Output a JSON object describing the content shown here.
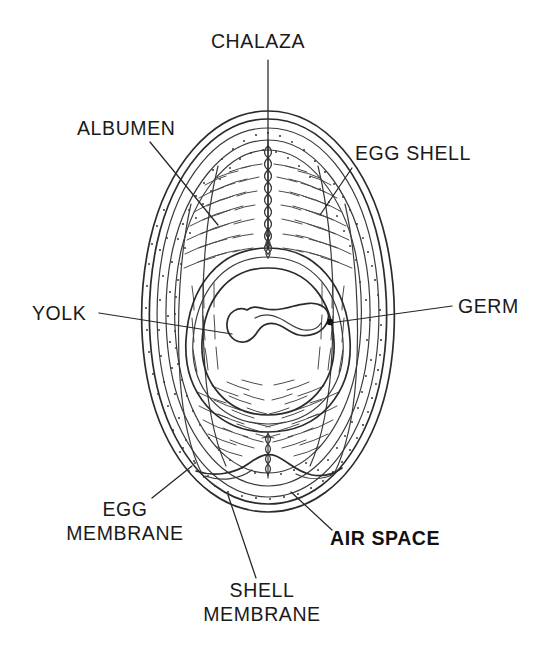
{
  "figure": {
    "background_color": "#ffffff",
    "line_color": "#2b2b2b",
    "text_color": "#1a1a1a",
    "width": 545,
    "height": 659
  },
  "labels": [
    {
      "id": "chalaza",
      "text": "CHALAZA",
      "lines": [
        "CHALAZA"
      ],
      "bold": false,
      "x": 258,
      "y": 48,
      "anchor": "middle",
      "leader_from": [
        268,
        60
      ],
      "leader_to": [
        268,
        250
      ]
    },
    {
      "id": "albumen",
      "text": "ALBUMEN",
      "lines": [
        "ALBUMEN"
      ],
      "bold": false,
      "x": 77,
      "y": 135,
      "anchor": "start",
      "leader_from": [
        150,
        142
      ],
      "leader_to": [
        218,
        225
      ]
    },
    {
      "id": "egg-shell",
      "text": "EGG  SHELL",
      "lines": [
        "EGG  SHELL"
      ],
      "bold": false,
      "x": 355,
      "y": 160,
      "anchor": "start",
      "leader_from": [
        352,
        168
      ],
      "leader_to": [
        320,
        215
      ]
    },
    {
      "id": "yolk",
      "text": "YOLK",
      "lines": [
        "YOLK"
      ],
      "bold": false,
      "x": 32,
      "y": 320,
      "anchor": "start",
      "leader_from": [
        99,
        313
      ],
      "leader_to": [
        232,
        334
      ]
    },
    {
      "id": "germ",
      "text": "GERM",
      "lines": [
        "GERM"
      ],
      "bold": false,
      "x": 458,
      "y": 313,
      "anchor": "start",
      "leader_from": [
        452,
        306
      ],
      "leader_to": [
        330,
        323
      ]
    },
    {
      "id": "egg-membrane",
      "text": "EGG MEMBRANE",
      "lines": [
        "EGG",
        "MEMBRANE"
      ],
      "bold": false,
      "x": 125,
      "y": 516,
      "anchor": "middle",
      "leader_from": [
        152,
        498
      ],
      "leader_to": [
        192,
        466
      ]
    },
    {
      "id": "shell-membrane",
      "text": "SHELL MEMBRANE",
      "lines": [
        "SHELL",
        "MEMBRANE"
      ],
      "bold": false,
      "x": 262,
      "y": 597,
      "anchor": "middle",
      "leader_from": [
        256,
        578
      ],
      "leader_to": [
        228,
        495
      ]
    },
    {
      "id": "air-space",
      "text": "AIR  SPACE",
      "lines": [
        "AIR  SPACE"
      ],
      "bold": true,
      "x": 330,
      "y": 545,
      "anchor": "start",
      "leader_from": [
        332,
        530
      ],
      "leader_to": [
        291,
        492
      ]
    }
  ],
  "structures": [
    {
      "id": "egg-shell-outer",
      "name": "egg shell outer wall"
    },
    {
      "id": "shell-membrane-layer",
      "name": "shell membrane"
    },
    {
      "id": "egg-membrane-layer",
      "name": "egg membrane"
    },
    {
      "id": "albumen-thick",
      "name": "thick albumen"
    },
    {
      "id": "albumen-thin",
      "name": "thin albumen"
    },
    {
      "id": "chalaza-cord",
      "name": "chalaza cord"
    },
    {
      "id": "vitelline-membrane",
      "name": "vitelline membrane"
    },
    {
      "id": "yolk-body",
      "name": "yolk"
    },
    {
      "id": "germ-blob",
      "name": "germinal disc / blastoderm"
    },
    {
      "id": "air-cell",
      "name": "air space"
    }
  ]
}
